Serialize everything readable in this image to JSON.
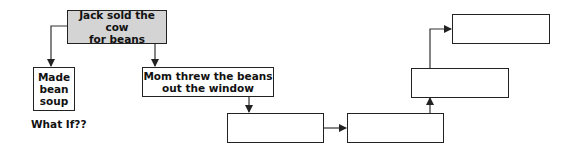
{
  "diagram": {
    "type": "flowchart",
    "nodes": [
      {
        "id": "start",
        "text": "Jack sold the cow for beans",
        "line1": "Jack sold the cow",
        "line2": "for beans",
        "shaded": true
      },
      {
        "id": "soup",
        "text": "Made bean soup",
        "line1": "Made",
        "line2": "bean",
        "line3": "soup"
      },
      {
        "id": "mom",
        "text": "Mom threw the beans out the window",
        "line1": "Mom threw the beans",
        "line2": "out the window"
      },
      {
        "id": "blank1",
        "text": ""
      },
      {
        "id": "blank2",
        "text": ""
      },
      {
        "id": "blank3",
        "text": ""
      },
      {
        "id": "blank4",
        "text": ""
      }
    ],
    "edges": [
      {
        "from": "start",
        "to": "soup"
      },
      {
        "from": "start",
        "to": "mom"
      },
      {
        "from": "mom",
        "to": "blank1"
      },
      {
        "from": "blank1",
        "to": "blank2"
      },
      {
        "from": "blank2",
        "to": "blank3"
      },
      {
        "from": "blank3",
        "to": "blank4"
      }
    ],
    "annotation": "What If??"
  }
}
